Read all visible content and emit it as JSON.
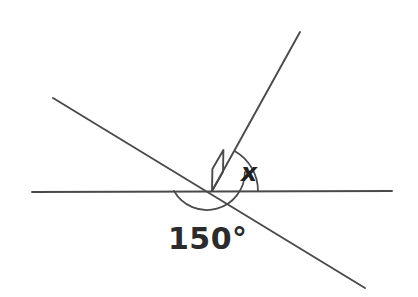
{
  "figure": {
    "type": "geometry-diagram",
    "background_color": "#ffffff",
    "stroke_color": "#4a4a4a",
    "text_color": "#2b2b2b",
    "width": 418,
    "height": 297
  },
  "labels": {
    "known_angle": "150°",
    "unknown_angle": "x"
  },
  "elements": {
    "horizontal_line_name": "horizontal-line",
    "transversal_line_name": "transversal-line",
    "ray_name": "oblique-ray",
    "right_angle_name": "right-angle-marker",
    "arc_150_name": "angle-arc-150",
    "arc_x_name": "angle-arc-x"
  },
  "geometry": {
    "intersection": {
      "x": 212,
      "y": 191
    },
    "horizontal_line": {
      "x1": 32,
      "y1": 192,
      "x2": 392,
      "y2": 191
    },
    "transversal_line": {
      "x1": 53,
      "y1": 98,
      "x2": 365,
      "y2": 288
    },
    "oblique_ray": {
      "x1": 212,
      "y1": 191,
      "x2": 300,
      "y2": 32
    },
    "angle_150_degrees": 150,
    "angle_x_degrees": 60,
    "right_angle_degrees": 90,
    "arc_150_radius": 38,
    "arc_x_radius": 46,
    "right_angle_size": 22
  }
}
